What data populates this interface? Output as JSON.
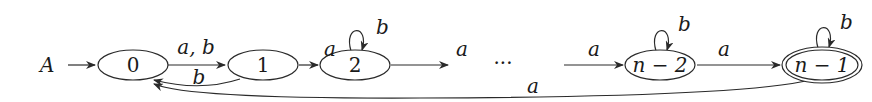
{
  "diagram": {
    "type": "finite-automaton",
    "start_label": "A",
    "states": [
      {
        "id": "0",
        "label": "0",
        "cx": 133,
        "accepting": false
      },
      {
        "id": "1",
        "label": "1",
        "cx": 263,
        "accepting": false
      },
      {
        "id": "2",
        "label": "2",
        "cx": 355,
        "accepting": false
      },
      {
        "id": "n-2",
        "label": "n − 2",
        "cx": 660,
        "accepting": false
      },
      {
        "id": "n-1",
        "label": "n − 1",
        "cx": 822,
        "accepting": true
      }
    ],
    "ellipsis": "···",
    "transitions": [
      {
        "from": "0",
        "to": "1",
        "label": "a, b"
      },
      {
        "from": "1",
        "to": "0",
        "label": "b"
      },
      {
        "from": "1",
        "to": "2",
        "label": "a"
      },
      {
        "from": "2",
        "to": "2",
        "label": "b"
      },
      {
        "from": "2",
        "to": "…",
        "label": "a"
      },
      {
        "from": "…",
        "to": "n-2",
        "label": "a"
      },
      {
        "from": "n-2",
        "to": "n-2",
        "label": "b"
      },
      {
        "from": "n-2",
        "to": "n-1",
        "label": "a"
      },
      {
        "from": "n-1",
        "to": "n-1",
        "label": "b"
      },
      {
        "from": "n-1",
        "to": "0",
        "label": "a"
      }
    ]
  }
}
